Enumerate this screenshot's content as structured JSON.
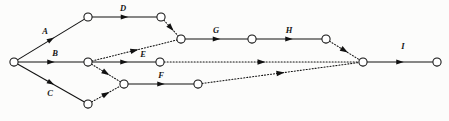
{
  "diagram": {
    "type": "activity-on-arrow network",
    "width": 449,
    "height": 121,
    "background_color": "#fcfcfb",
    "line_color": "#111111",
    "node_fill": "#ffffff",
    "node_radius": 4.1,
    "nodes": [
      {
        "id": "n0",
        "name": "start-node",
        "x": 14,
        "y": 62
      },
      {
        "id": "n1",
        "name": "node-a-end",
        "x": 88,
        "y": 17
      },
      {
        "id": "n2",
        "name": "node-d-end",
        "x": 161,
        "y": 17
      },
      {
        "id": "n3",
        "name": "node-b-end",
        "x": 88,
        "y": 62
      },
      {
        "id": "n4",
        "name": "node-c-end",
        "x": 88,
        "y": 104
      },
      {
        "id": "n5",
        "name": "node-f-start",
        "x": 124,
        "y": 84
      },
      {
        "id": "n6",
        "name": "node-e-end",
        "x": 160,
        "y": 62
      },
      {
        "id": "n7",
        "name": "node-g-start",
        "x": 181,
        "y": 39
      },
      {
        "id": "n8",
        "name": "node-f-end",
        "x": 198,
        "y": 84
      },
      {
        "id": "n9",
        "name": "node-g-end",
        "x": 252,
        "y": 39
      },
      {
        "id": "n10",
        "name": "node-h-end",
        "x": 326,
        "y": 39
      },
      {
        "id": "n11",
        "name": "convergence-node",
        "x": 363,
        "y": 62
      },
      {
        "id": "n12",
        "name": "finish-node",
        "x": 437,
        "y": 62
      }
    ],
    "edges": [
      {
        "id": "e-a",
        "name": "edge-a",
        "from": "n0",
        "to": "n1",
        "style": "solid",
        "label": "A",
        "label_x": 45,
        "label_y": 34
      },
      {
        "id": "e-b",
        "name": "edge-b",
        "from": "n0",
        "to": "n3",
        "style": "solid",
        "label": "B",
        "label_x": 55,
        "label_y": 56
      },
      {
        "id": "e-c",
        "name": "edge-c",
        "from": "n0",
        "to": "n4",
        "style": "solid",
        "label": "C",
        "label_x": 50,
        "label_y": 96
      },
      {
        "id": "e-d",
        "name": "edge-d",
        "from": "n1",
        "to": "n2",
        "style": "solid",
        "label": "D",
        "label_x": 123,
        "label_y": 11
      },
      {
        "id": "e-e",
        "name": "edge-e",
        "from": "n3",
        "to": "n6",
        "style": "solid",
        "label": "E",
        "label_x": 143,
        "label_y": 57
      },
      {
        "id": "e-f",
        "name": "edge-f",
        "from": "n5",
        "to": "n8",
        "style": "solid",
        "label": "F",
        "label_x": 161,
        "label_y": 78
      },
      {
        "id": "e-g",
        "name": "edge-g",
        "from": "n7",
        "to": "n9",
        "style": "solid",
        "label": "G",
        "label_x": 216,
        "label_y": 33
      },
      {
        "id": "e-h",
        "name": "edge-h",
        "from": "n9",
        "to": "n10",
        "style": "solid",
        "label": "H",
        "label_x": 289,
        "label_y": 33
      },
      {
        "id": "e-i",
        "name": "edge-i",
        "from": "n11",
        "to": "n12",
        "style": "solid",
        "label": "I",
        "label_x": 403,
        "label_y": 49
      },
      {
        "id": "e-d1",
        "name": "dummy-edge-d-to-g-start",
        "from": "n2",
        "to": "n7",
        "style": "dotted",
        "label": "",
        "label_x": 0,
        "label_y": 0
      },
      {
        "id": "e-d2",
        "name": "dummy-edge-b-to-g-start",
        "from": "n3",
        "to": "n7",
        "style": "dotted",
        "label": "",
        "label_x": 0,
        "label_y": 0
      },
      {
        "id": "e-d3",
        "name": "dummy-edge-b-to-f-start",
        "from": "n3",
        "to": "n5",
        "style": "dotted",
        "label": "",
        "label_x": 0,
        "label_y": 0
      },
      {
        "id": "e-d4",
        "name": "dummy-edge-c-to-f-start",
        "from": "n4",
        "to": "n5",
        "style": "dotted",
        "label": "",
        "label_x": 0,
        "label_y": 0
      },
      {
        "id": "e-d5",
        "name": "dummy-edge-e-to-convergence",
        "from": "n6",
        "to": "n11",
        "style": "dotted",
        "label": "",
        "label_x": 0,
        "label_y": 0
      },
      {
        "id": "e-d6",
        "name": "dummy-edge-f-to-convergence",
        "from": "n8",
        "to": "n11",
        "style": "dotted",
        "label": "",
        "label_x": 0,
        "label_y": 0
      },
      {
        "id": "e-d7",
        "name": "dummy-edge-h-to-convergence",
        "from": "n10",
        "to": "n11",
        "style": "dotted",
        "label": "",
        "label_x": 0,
        "label_y": 0
      }
    ],
    "labels": [
      "A",
      "B",
      "C",
      "D",
      "E",
      "F",
      "G",
      "H",
      "I"
    ]
  }
}
